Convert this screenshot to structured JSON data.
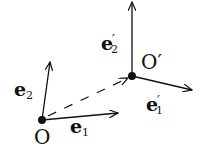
{
  "diagram": {
    "origin_label": "O",
    "origin_prime_label": "O′",
    "e1": {
      "base": "e",
      "sub": "1",
      "prime": ""
    },
    "e2": {
      "base": "e",
      "sub": "2",
      "prime": ""
    },
    "e1p": {
      "base": "e",
      "sub": "1",
      "prime": "′"
    },
    "e2p": {
      "base": "e",
      "sub": "2",
      "prime": "′"
    },
    "color": "#111111"
  }
}
